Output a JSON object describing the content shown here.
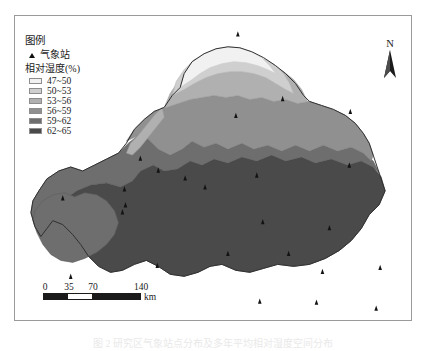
{
  "figure": {
    "caption": "图 2   研究区气象站点分布及多年平均相对湿度空间分布"
  },
  "map": {
    "legend": {
      "title": "图例",
      "station_label": "气象站",
      "station_icon": "triangle-marker-icon",
      "variable_label": "相对湿度(%)",
      "classes": [
        {
          "range": "47~50",
          "color": "#f1f1f1"
        },
        {
          "range": "50~53",
          "color": "#cfcfcf"
        },
        {
          "range": "53~56",
          "color": "#b0b0b0"
        },
        {
          "range": "56~59",
          "color": "#909090"
        },
        {
          "range": "59~62",
          "color": "#6e6e6e"
        },
        {
          "range": "62~65",
          "color": "#4a4a4a"
        }
      ]
    },
    "north_arrow": {
      "label": "N",
      "icon": "north-arrow-icon"
    },
    "scale_bar": {
      "ticks": [
        "0",
        "35",
        "70",
        "140"
      ],
      "unit": "km"
    }
  },
  "chart_data": {
    "type": "map",
    "title": "相对湿度(%)",
    "classification": "choropleth",
    "class_breaks": [
      47,
      50,
      53,
      56,
      59,
      62,
      65
    ],
    "class_labels": [
      "47~50",
      "50~53",
      "53~56",
      "56~59",
      "59~62",
      "62~65"
    ],
    "class_colors": [
      "#f1f1f1",
      "#cfcfcf",
      "#b0b0b0",
      "#909090",
      "#6e6e6e",
      "#4a4a4a"
    ],
    "legend_position": "top-left",
    "scale_bar_ticks": [
      0,
      35,
      70,
      140
    ],
    "scale_bar_unit": "km",
    "station_count": 25,
    "stations": [
      {
        "x": 238,
        "y": 33
      },
      {
        "x": 283,
        "y": 98
      },
      {
        "x": 236,
        "y": 115
      },
      {
        "x": 351,
        "y": 111
      },
      {
        "x": 257,
        "y": 175
      },
      {
        "x": 205,
        "y": 187
      },
      {
        "x": 350,
        "y": 165
      },
      {
        "x": 158,
        "y": 170
      },
      {
        "x": 185,
        "y": 178
      },
      {
        "x": 140,
        "y": 158
      },
      {
        "x": 124,
        "y": 189
      },
      {
        "x": 62,
        "y": 198
      },
      {
        "x": 122,
        "y": 212
      },
      {
        "x": 263,
        "y": 222
      },
      {
        "x": 330,
        "y": 228
      },
      {
        "x": 157,
        "y": 266
      },
      {
        "x": 70,
        "y": 277
      },
      {
        "x": 289,
        "y": 254
      },
      {
        "x": 228,
        "y": 254
      },
      {
        "x": 323,
        "y": 272
      },
      {
        "x": 381,
        "y": 268
      },
      {
        "x": 260,
        "y": 302
      },
      {
        "x": 317,
        "y": 303
      },
      {
        "x": 377,
        "y": 309
      },
      {
        "x": 125,
        "y": 205
      }
    ]
  }
}
